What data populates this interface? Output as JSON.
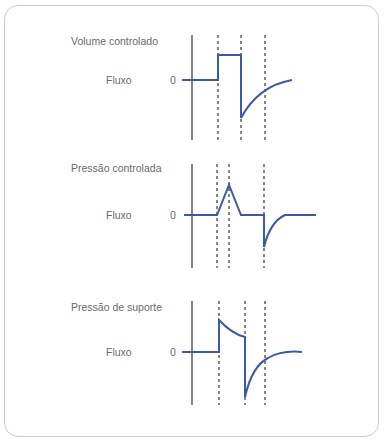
{
  "panels": [
    {
      "title": "Volume controlado",
      "ylabel": "Fluxo",
      "zero": "0"
    },
    {
      "title": "Pressão controlada",
      "ylabel": "Fluxo",
      "zero": "0"
    },
    {
      "title": "Pressão de suporte",
      "ylabel": "Fluxo",
      "zero": "0"
    }
  ],
  "colors": {
    "trace": "#3a5aa8",
    "axis": "#444444",
    "dash": "#444444",
    "border": "#c9ccd6"
  }
}
